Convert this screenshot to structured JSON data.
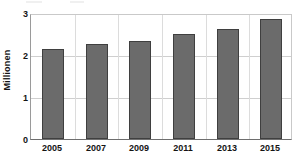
{
  "chart_data": {
    "type": "bar",
    "title": "",
    "subtitle": "",
    "xlabel": "",
    "ylabel": "Millionen",
    "categories": [
      "2005",
      "2007",
      "2009",
      "2011",
      "2013",
      "2015"
    ],
    "values": [
      2.15,
      2.25,
      2.33,
      2.5,
      2.63,
      2.85
    ],
    "series": [
      {
        "name": "Millionen",
        "values": [
          2.15,
          2.25,
          2.33,
          2.5,
          2.63,
          2.85
        ]
      }
    ],
    "ylim": [
      0,
      3
    ],
    "yticks": [
      0,
      1,
      2,
      3
    ],
    "ytick_labels": [
      "0",
      "1",
      "2",
      "3"
    ],
    "xlim_categories": 6,
    "grid": "horizontal-and-vertical",
    "legend": "none",
    "bar_color": "#6b6b6b",
    "bar_edge_color": "#3f3f3f",
    "grid_color": "#cfcfcf",
    "axis_color": "#6e6e6e",
    "text_color": "#141414",
    "background": "#ffffff"
  }
}
